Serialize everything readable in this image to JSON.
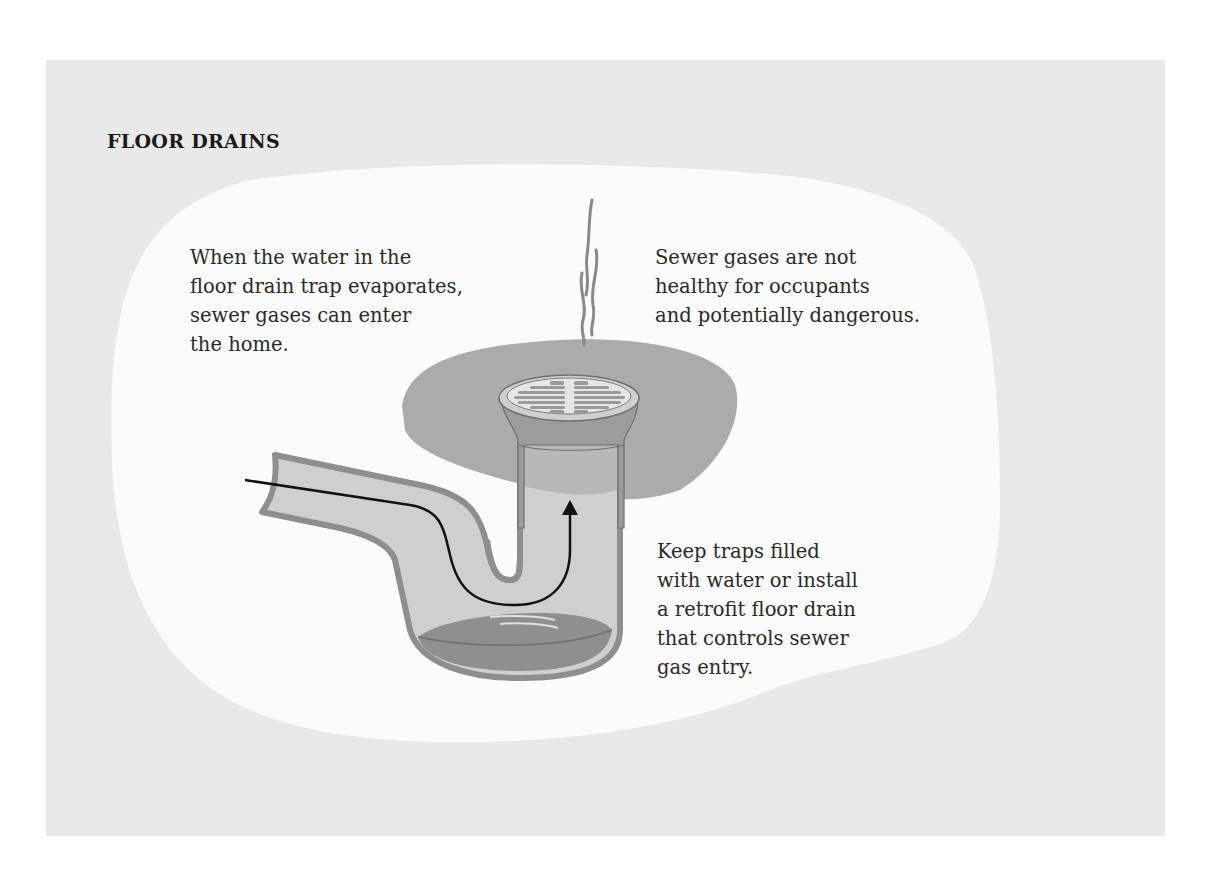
{
  "title": "FLOOR DRAINS",
  "captions": {
    "evaporation": {
      "lines": [
        "When the water in the",
        "floor drain trap evaporates,",
        "sewer gases can enter",
        "the home."
      ]
    },
    "health": {
      "lines": [
        "Sewer gases are not",
        "healthy for occupants",
        "and potentially dangerous."
      ]
    },
    "solution": {
      "lines": [
        "Keep traps filled",
        "with water or install",
        "a retrofit floor drain",
        "that controls sewer",
        "gas entry."
      ]
    }
  },
  "illustration": {
    "subject": "P-trap floor drain with evaporated water, showing sewer gas path",
    "elements": [
      "floor-slab",
      "drain-grate",
      "p-trap-pipe",
      "trap-water",
      "gas-flow-arrow",
      "odor-wisps"
    ]
  },
  "colors": {
    "panel_bg": "#e9e9e9",
    "blob_bg": "#fbfbfb",
    "floor_slab": "#a9a9a9",
    "pipe_wall": "#8e8e8e",
    "pipe_inside": "#cfcfcf",
    "water": "#8f8f8f",
    "text": "#2a2a2a"
  }
}
